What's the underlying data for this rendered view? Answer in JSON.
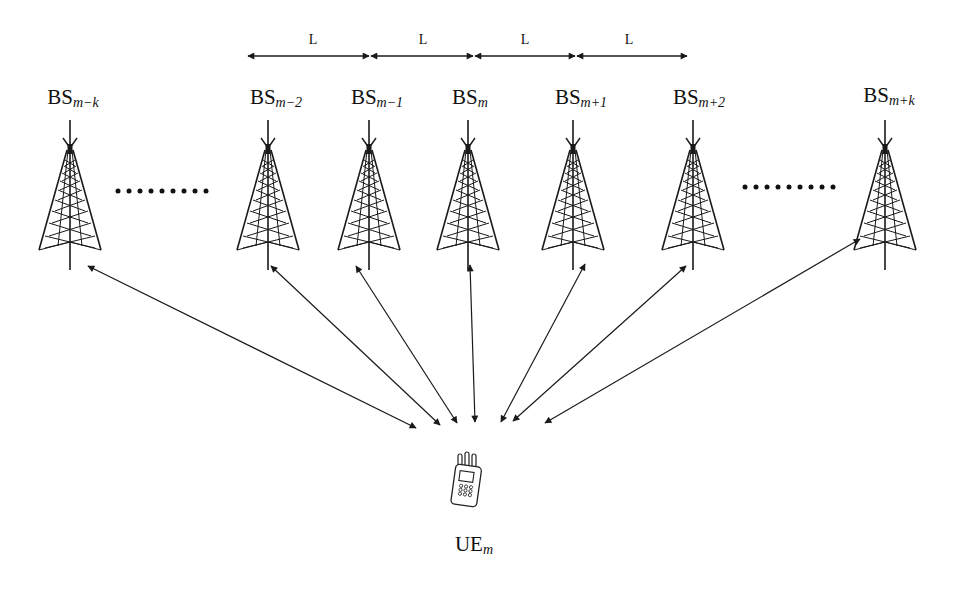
{
  "diagram": {
    "type": "multi-base-station-network",
    "colors": {
      "line": "#1a1a1a",
      "background": "#ffffff"
    },
    "spacing": {
      "label": "L",
      "segments": [
        {
          "label": "L",
          "x1": 247,
          "x2": 370,
          "label_x": 313
        },
        {
          "label": "L",
          "x1": 370,
          "x2": 474,
          "label_x": 423
        },
        {
          "label": "L",
          "x1": 474,
          "x2": 576,
          "label_x": 525
        },
        {
          "label": "L",
          "x1": 576,
          "x2": 688,
          "label_x": 629
        }
      ],
      "y": 56
    },
    "base_stations": [
      {
        "id": "bs-m-k",
        "base": "BS",
        "sub": "m−k",
        "x": 70,
        "label_x": 73
      },
      {
        "id": "bs-m-2",
        "base": "BS",
        "sub": "m−2",
        "x": 268,
        "label_x": 276
      },
      {
        "id": "bs-m-1",
        "base": "BS",
        "sub": "m−1",
        "x": 369,
        "label_x": 377
      },
      {
        "id": "bs-m",
        "base": "BS",
        "sub": "m",
        "x": 468,
        "label_x": 470
      },
      {
        "id": "bs-m+1",
        "base": "BS",
        "sub": "m+1",
        "x": 573,
        "label_x": 581
      },
      {
        "id": "bs-m+2",
        "base": "BS",
        "sub": "m+2",
        "x": 693,
        "label_x": 699
      },
      {
        "id": "bs-m+k",
        "base": "BS",
        "sub": "m+k",
        "x": 885,
        "label_x": 889
      }
    ],
    "ellipses": [
      {
        "text": "·········",
        "x": 162,
        "y": 191
      },
      {
        "text": "·········",
        "x": 789,
        "y": 187
      }
    ],
    "user_equipment": {
      "base": "UE",
      "sub": "m",
      "x": 470,
      "label_x": 474,
      "label_y": 540
    },
    "links": [
      {
        "from": "bs-m-k",
        "x1": 88,
        "y1": 266,
        "x2": 416,
        "y2": 428
      },
      {
        "from": "bs-m-2",
        "x1": 271,
        "y1": 266,
        "x2": 440,
        "y2": 425
      },
      {
        "from": "bs-m-1",
        "x1": 356,
        "y1": 266,
        "x2": 457,
        "y2": 423
      },
      {
        "from": "bs-m",
        "x1": 470,
        "y1": 265,
        "x2": 475,
        "y2": 422
      },
      {
        "from": "bs-m+1",
        "x1": 585,
        "y1": 264,
        "x2": 501,
        "y2": 422
      },
      {
        "from": "bs-m+2",
        "x1": 686,
        "y1": 266,
        "x2": 513,
        "y2": 421
      },
      {
        "from": "bs-m+k",
        "x1": 860,
        "y1": 239,
        "x2": 545,
        "y2": 423
      }
    ]
  }
}
